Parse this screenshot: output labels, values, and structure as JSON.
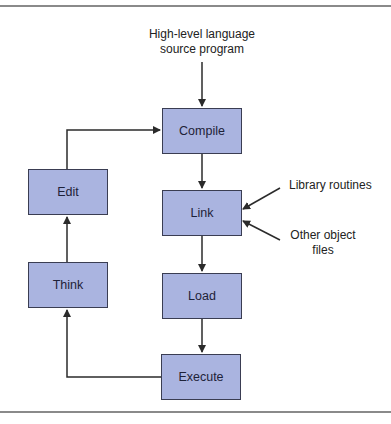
{
  "diagram": {
    "type": "flowchart",
    "colors": {
      "box_fill": "#aab4e0",
      "box_border": "#3a3d52",
      "line": "#2b2b2b",
      "rule": "#8a8a8a"
    },
    "input_label_line1": "High-level language",
    "input_label_line2": "source program",
    "nodes": {
      "compile": "Compile",
      "link": "Link",
      "load": "Load",
      "execute": "Execute",
      "think": "Think",
      "edit": "Edit"
    },
    "side_inputs": {
      "library": "Library routines",
      "other_line1": "Other object",
      "other_line2": "files"
    },
    "edges": [
      [
        "source program",
        "Compile"
      ],
      [
        "Compile",
        "Link"
      ],
      [
        "Library routines",
        "Link"
      ],
      [
        "Other object files",
        "Link"
      ],
      [
        "Link",
        "Load"
      ],
      [
        "Load",
        "Execute"
      ],
      [
        "Execute",
        "Think"
      ],
      [
        "Think",
        "Edit"
      ],
      [
        "Edit",
        "Compile"
      ]
    ]
  }
}
